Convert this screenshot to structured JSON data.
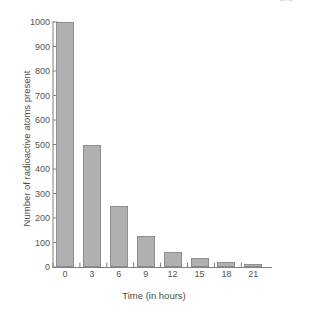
{
  "page_number": "424",
  "chart_data": {
    "type": "bar",
    "title": "",
    "xlabel": "Time (in hours)",
    "ylabel": "Number of radioactive atoms present",
    "categories": [
      "0",
      "3",
      "6",
      "9",
      "12",
      "15",
      "18",
      "21"
    ],
    "values": [
      1000,
      500,
      250,
      125,
      63,
      35,
      20,
      12
    ],
    "ylim": [
      0,
      1000
    ],
    "y_ticks": [
      "0",
      "100",
      "200",
      "300",
      "400",
      "500",
      "600",
      "700",
      "800",
      "900",
      "1000"
    ],
    "x_ticks": [
      "0",
      "3",
      "6",
      "9",
      "12",
      "15",
      "18",
      "21"
    ],
    "grid": false,
    "legend": false,
    "bar_color": "#b0b0b0",
    "bar_edge_color": "#8e8e8e",
    "axis_color": "#808080",
    "background": "#ffffff"
  }
}
